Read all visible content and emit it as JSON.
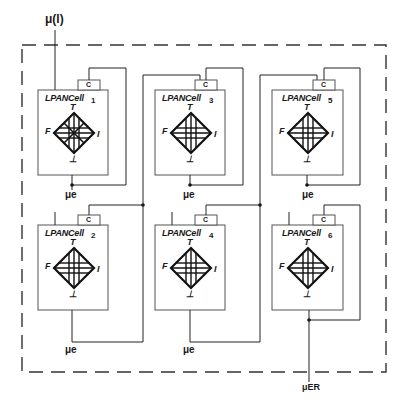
{
  "diagram": {
    "input_label": "μ(l)",
    "output_label": "μER",
    "cell_title": "LPANCell",
    "connector_label": "C",
    "cell_output_label": "μe",
    "poles": {
      "top": "T",
      "bottom": "⊥",
      "left": "F",
      "right": "I"
    },
    "cells": [
      {
        "id": "1",
        "x": 38,
        "y": 90
      },
      {
        "id": "2",
        "x": 38,
        "y": 225
      },
      {
        "id": "3",
        "x": 155,
        "y": 90
      },
      {
        "id": "4",
        "x": 155,
        "y": 225
      },
      {
        "id": "5",
        "x": 272,
        "y": 90
      },
      {
        "id": "6",
        "x": 272,
        "y": 225
      }
    ],
    "colors": {
      "line": "#1a1a1a",
      "box": "#555555",
      "background": "#ffffff"
    }
  }
}
